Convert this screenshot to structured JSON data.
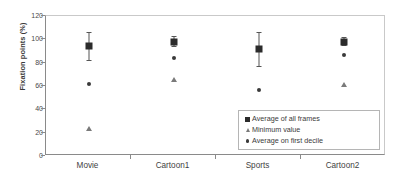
{
  "chart_data": {
    "type": "scatter",
    "title": "",
    "xlabel": "",
    "ylabel": "Fixation points (%)",
    "ylim": [
      0,
      120
    ],
    "ytick_step": 20,
    "yticks": [
      0,
      20,
      40,
      60,
      80,
      100,
      120
    ],
    "ytick_labels": [
      "0",
      "20",
      "40",
      "60",
      "80",
      "100",
      "120"
    ],
    "grid": false,
    "legend_position": "lower-right",
    "categories": [
      "Movie",
      "Cartoon1",
      "Sports",
      "Cartoon2"
    ],
    "series": [
      {
        "name": "Average of all frames",
        "marker": "square",
        "color": "#2b2b2b",
        "values": [
          94,
          98,
          92,
          98
        ],
        "error_low": [
          82,
          94,
          77,
          95
        ],
        "error_high": [
          106,
          103,
          106,
          102
        ]
      },
      {
        "name": "Minimum value",
        "marker": "triangle",
        "color": "#7a7a7a",
        "values": [
          23,
          65,
          12,
          61
        ]
      },
      {
        "name": "Average on first decile",
        "marker": "dot",
        "color": "#3a3a3a",
        "values": [
          62,
          84,
          57,
          87
        ]
      }
    ],
    "legend": [
      {
        "label": "Average of all frames",
        "marker": "square"
      },
      {
        "label": "Minimum value",
        "marker": "triangle"
      },
      {
        "label": "Average on first decile",
        "marker": "dot"
      }
    ]
  },
  "colors": {
    "axis": "#8a8a8a",
    "frame": "#c9c9c9",
    "text": "#3a3a3a",
    "background": "#ffffff"
  }
}
